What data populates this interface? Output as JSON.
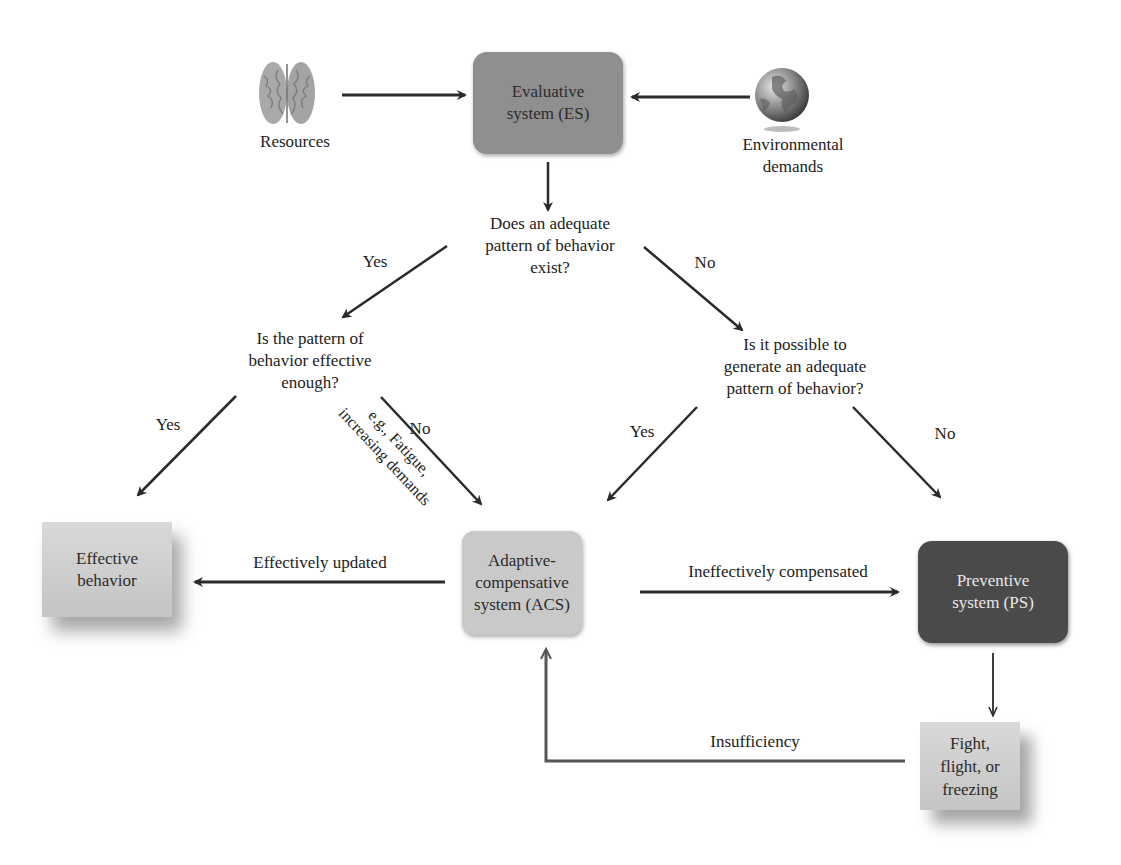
{
  "diagram": {
    "inputs": {
      "resources": {
        "label": "Resources",
        "icon": "brain-icon"
      },
      "environmental_demands": {
        "label": "Environmental\ndemands",
        "icon": "globe-icon"
      }
    },
    "nodes": {
      "evaluative_system": {
        "label": "Evaluative\nsystem (ES)",
        "color": "#8f8f8f"
      },
      "adaptive_compensative_system": {
        "label": "Adaptive-\ncompensative\nsystem (ACS)",
        "color": "#c9c9c9"
      },
      "preventive_system": {
        "label": "Preventive\nsystem (PS)",
        "color": "#4a4a4a"
      },
      "effective_behavior": {
        "label": "Effective\nbehavior",
        "color": "#cfcfcf"
      },
      "fight_flight_freezing": {
        "label": "Fight,\nflight, or\nfreezing",
        "color": "#cfcfcf"
      }
    },
    "questions": {
      "q1": "Does an adequate\npattern of behavior\nexist?",
      "q2": "Is the pattern of\nbehavior effective\nenough?",
      "q3": "Is it possible to\ngenerate an adequate\npattern of behavior?"
    },
    "edge_labels": {
      "q1_yes": "Yes",
      "q1_no": "No",
      "q2_yes": "Yes",
      "q2_no": "No",
      "q2_note": "e.g., Fatigue,\nincreasing demands",
      "q3_yes": "Yes",
      "q3_no": "No",
      "effectively_updated": "Effectively updated",
      "ineffectively_compensated": "Ineffectively compensated",
      "insufficiency": "Insufficiency"
    },
    "colors": {
      "arrow": "#2a2a2a",
      "feedback_arrow": "#555555"
    }
  }
}
